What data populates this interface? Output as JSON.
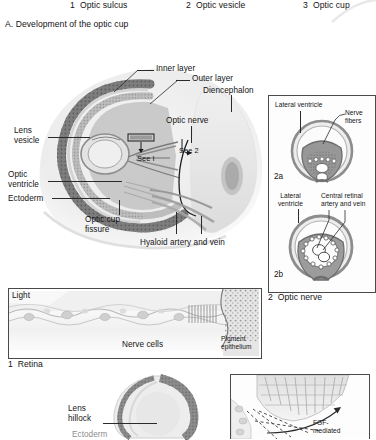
{
  "figure": {
    "stage_labels": [
      {
        "number": "1",
        "text": "Optic sulcus"
      },
      {
        "number": "2",
        "text": "Optic vesicle"
      },
      {
        "number": "3",
        "text": "Optic cup"
      }
    ],
    "section_title": "A. Development of the optic cup"
  },
  "main_diagram": {
    "name": "optic-cup-development-main",
    "labels": {
      "inner_layer": "Inner layer",
      "outer_layer": "Outer layer",
      "diencephalon": "Diencephalon",
      "optic_nerve": "Optic nerve",
      "lens_vesicle": "Lens\nvesicle",
      "optic_ventricle": "Optic\nventricle",
      "ectoderm": "Ectoderm",
      "optic_cup_fissure": "Optic cup\nfissure",
      "hyaloid": "Hyaloid artery and vein",
      "see_1": "See I",
      "see_2": "See 2"
    }
  },
  "optic_nerve_panel": {
    "caption": "2  Optic nerve",
    "sub_a": {
      "tag": "2a",
      "labels": {
        "lateral_ventricle": "Lateral ventricle",
        "nerve_fibers": "Nerve\nfibers"
      }
    },
    "sub_b": {
      "tag": "2b",
      "labels": {
        "lateral_ventricle": "Lateral\nventricle",
        "central_retinal": "Central retinal\nartery and vein"
      }
    }
  },
  "retina_panel": {
    "caption": "1  Retina",
    "labels": {
      "light": "Light",
      "nerve_cells": "Nerve cells",
      "pigment_epithelium": "Pigment\nepithelium"
    }
  },
  "bottom_panels": {
    "lens_hillock": {
      "label": "Lens\nhillock",
      "cut_label": "Ectoderm"
    },
    "fgf_panel": {
      "label": "FGF-\nmediated"
    }
  },
  "colors": {
    "ink": "#141414",
    "line": "#2a2a2a",
    "panel_border": "#4a4a4a",
    "tissue_light": "#d9d9d9",
    "tissue_mid": "#b6b6b6",
    "tissue_dark": "#8f8f8f",
    "tissue_darker": "#6f6f6f",
    "paper": "#ffffff"
  }
}
